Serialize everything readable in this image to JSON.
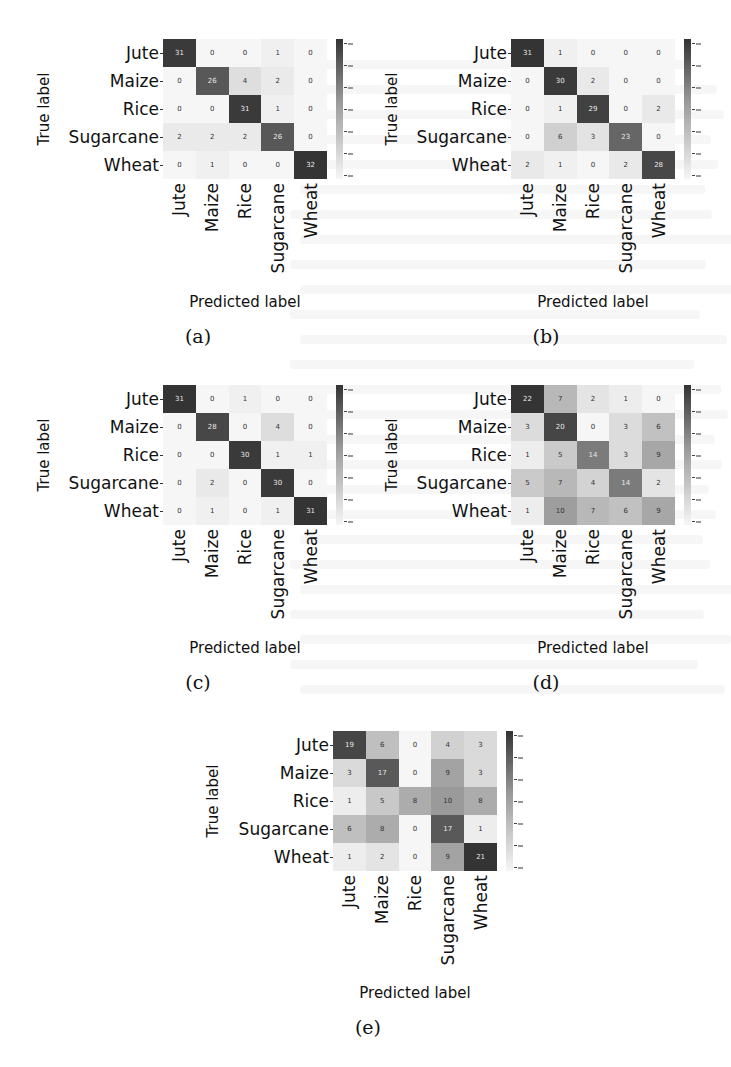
{
  "figure": {
    "class_labels": [
      "Jute",
      "Maize",
      "Rice",
      "Sugarcane",
      "Wheat"
    ],
    "y_axis_label": "True label",
    "x_axis_label": "Predicted label"
  },
  "chart_data": [
    {
      "type": "heatmap",
      "title": "(a)",
      "xlabel": "Predicted label",
      "ylabel": "True label",
      "x_categories": [
        "Jute",
        "Maize",
        "Rice",
        "Sugarcane",
        "Wheat"
      ],
      "y_categories": [
        "Jute",
        "Maize",
        "Rice",
        "Sugarcane",
        "Wheat"
      ],
      "values": [
        [
          31,
          0,
          0,
          1,
          0
        ],
        [
          0,
          26,
          4,
          2,
          0
        ],
        [
          0,
          0,
          31,
          1,
          0
        ],
        [
          2,
          2,
          2,
          26,
          0
        ],
        [
          0,
          1,
          0,
          0,
          32
        ]
      ],
      "colormap": "greys",
      "colorbar": true
    },
    {
      "type": "heatmap",
      "title": "(b)",
      "xlabel": "Predicted label",
      "ylabel": "True label",
      "x_categories": [
        "Jute",
        "Maize",
        "Rice",
        "Sugarcane",
        "Wheat"
      ],
      "y_categories": [
        "Jute",
        "Maize",
        "Rice",
        "Sugarcane",
        "Wheat"
      ],
      "values": [
        [
          31,
          1,
          0,
          0,
          0
        ],
        [
          0,
          30,
          2,
          0,
          0
        ],
        [
          0,
          1,
          29,
          0,
          2
        ],
        [
          0,
          6,
          3,
          23,
          0
        ],
        [
          2,
          1,
          0,
          2,
          28
        ]
      ],
      "colormap": "greys",
      "colorbar": true
    },
    {
      "type": "heatmap",
      "title": "(c)",
      "xlabel": "Predicted label",
      "ylabel": "True label",
      "x_categories": [
        "Jute",
        "Maize",
        "Rice",
        "Sugarcane",
        "Wheat"
      ],
      "y_categories": [
        "Jute",
        "Maize",
        "Rice",
        "Sugarcane",
        "Wheat"
      ],
      "values": [
        [
          31,
          0,
          1,
          0,
          0
        ],
        [
          0,
          28,
          0,
          4,
          0
        ],
        [
          0,
          0,
          30,
          1,
          1
        ],
        [
          0,
          2,
          0,
          30,
          0
        ],
        [
          0,
          1,
          0,
          1,
          31
        ]
      ],
      "colormap": "greys",
      "colorbar": true
    },
    {
      "type": "heatmap",
      "title": "(d)",
      "xlabel": "Predicted label",
      "ylabel": "True label",
      "x_categories": [
        "Jute",
        "Maize",
        "Rice",
        "Sugarcane",
        "Wheat"
      ],
      "y_categories": [
        "Jute",
        "Maize",
        "Rice",
        "Sugarcane",
        "Wheat"
      ],
      "values": [
        [
          22,
          7,
          2,
          1,
          0
        ],
        [
          3,
          20,
          0,
          3,
          6
        ],
        [
          1,
          5,
          14,
          3,
          9
        ],
        [
          5,
          7,
          4,
          14,
          2
        ],
        [
          1,
          10,
          7,
          6,
          9
        ]
      ],
      "colormap": "greys",
      "colorbar": true
    },
    {
      "type": "heatmap",
      "title": "(e)",
      "xlabel": "Predicted label",
      "ylabel": "True label",
      "x_categories": [
        "Jute",
        "Maize",
        "Rice",
        "Sugarcane",
        "Wheat"
      ],
      "y_categories": [
        "Jute",
        "Maize",
        "Rice",
        "Sugarcane",
        "Wheat"
      ],
      "values": [
        [
          19,
          6,
          0,
          4,
          3
        ],
        [
          3,
          17,
          0,
          9,
          3
        ],
        [
          1,
          5,
          8,
          10,
          8
        ],
        [
          6,
          8,
          0,
          17,
          1
        ],
        [
          1,
          2,
          0,
          9,
          21
        ]
      ],
      "colormap": "greys",
      "colorbar": true
    }
  ],
  "colors": {
    "dark": "#353535",
    "light": "#f5f5f5"
  }
}
